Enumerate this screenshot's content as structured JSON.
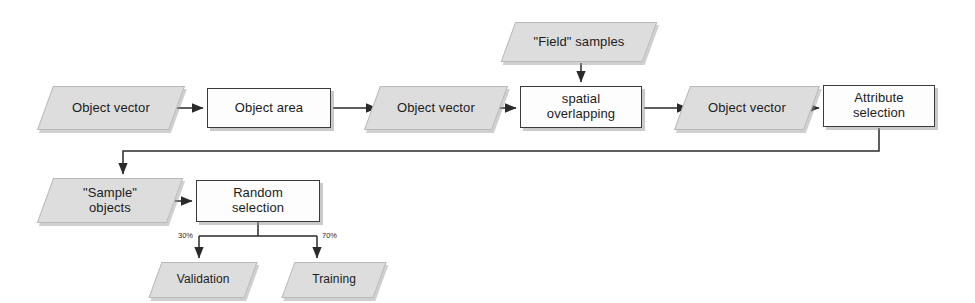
{
  "diagram": {
    "style": {
      "data_fill": "#dddddd",
      "data_border": "#b9b9b9",
      "process_fill": "#fdfdfd",
      "process_border": "#3a3a3a",
      "line_color": "#2a2a2a",
      "background": "#ffffff"
    },
    "nodes": [
      {
        "id": "object_vector_1",
        "label": "Object vector",
        "shape": "parallelogram",
        "x": 45,
        "y": 86,
        "w": 132,
        "h": 44
      },
      {
        "id": "object_area",
        "label": "Object area",
        "shape": "rectangle",
        "x": 207,
        "y": 88,
        "w": 124,
        "h": 40
      },
      {
        "id": "object_vector_2",
        "label": "Object vector",
        "shape": "parallelogram",
        "x": 372,
        "y": 86,
        "w": 128,
        "h": 44
      },
      {
        "id": "field_samples",
        "label": "\"Field\" samples",
        "shape": "parallelogram",
        "x": 508,
        "y": 22,
        "w": 142,
        "h": 40
      },
      {
        "id": "spatial_overlap",
        "label": "spatial\noverlapping",
        "shape": "rectangle",
        "x": 520,
        "y": 86,
        "w": 122,
        "h": 42
      },
      {
        "id": "object_vector_3",
        "label": "Object vector",
        "shape": "parallelogram",
        "x": 682,
        "y": 86,
        "w": 130,
        "h": 44
      },
      {
        "id": "attribute_select",
        "label": "Attribute\nselection",
        "shape": "rectangle",
        "x": 823,
        "y": 85,
        "w": 112,
        "h": 42
      },
      {
        "id": "sample_objects",
        "label": "\"Sample\"\nobjects",
        "shape": "parallelogram",
        "x": 45,
        "y": 178,
        "w": 130,
        "h": 45
      },
      {
        "id": "random_select",
        "label": "Random\nselection",
        "shape": "rectangle",
        "x": 196,
        "y": 180,
        "w": 124,
        "h": 42
      },
      {
        "id": "validation",
        "label": "Validation",
        "shape": "parallelogram",
        "x": 155,
        "y": 262,
        "w": 96,
        "h": 36
      },
      {
        "id": "training",
        "label": "Training",
        "shape": "parallelogram",
        "x": 288,
        "y": 262,
        "w": 92,
        "h": 36
      }
    ],
    "edges": [
      {
        "id": "e1",
        "from": "object_vector_1",
        "to": "object_area",
        "label": ""
      },
      {
        "id": "e2",
        "from": "object_area",
        "to": "object_vector_2",
        "label": ""
      },
      {
        "id": "e3",
        "from": "object_vector_2",
        "to": "spatial_overlap",
        "label": ""
      },
      {
        "id": "e4",
        "from": "field_samples",
        "to": "spatial_overlap",
        "label": ""
      },
      {
        "id": "e5",
        "from": "spatial_overlap",
        "to": "object_vector_3",
        "label": ""
      },
      {
        "id": "e6",
        "from": "object_vector_3",
        "to": "attribute_select",
        "label": ""
      },
      {
        "id": "e7",
        "from": "attribute_select",
        "to": "sample_objects",
        "label": ""
      },
      {
        "id": "e8",
        "from": "sample_objects",
        "to": "random_select",
        "label": ""
      },
      {
        "id": "e9",
        "from": "random_select",
        "to": "validation",
        "label": "30%"
      },
      {
        "id": "e10",
        "from": "random_select",
        "to": "training",
        "label": "70%"
      }
    ],
    "labels": {
      "object_vector_1": "Object vector",
      "object_area": "Object area",
      "object_vector_2": "Object vector",
      "field_samples": "\"Field\" samples",
      "spatial_overlap_line1": "spatial",
      "spatial_overlap_line2": "overlapping",
      "object_vector_3": "Object vector",
      "attribute_select_line1": "Attribute",
      "attribute_select_line2": "selection",
      "sample_objects_line1": "\"Sample\"",
      "sample_objects_line2": "objects",
      "random_select_line1": "Random",
      "random_select_line2": "selection",
      "validation": "Validation",
      "training": "Training",
      "split_validation_pct": "30%",
      "split_training_pct": "70%"
    }
  }
}
